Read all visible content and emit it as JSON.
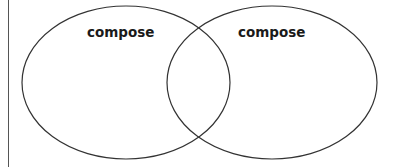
{
  "diagram": {
    "type": "venn",
    "sets": [
      {
        "label": "compose",
        "cx": 126,
        "cy": 82.5,
        "rx": 104,
        "ry": 76.5
      },
      {
        "label": "compose",
        "cx": 272,
        "cy": 82.5,
        "rx": 105,
        "ry": 76.5
      }
    ],
    "stroke_color": "#333333",
    "border_color": "#555555"
  }
}
